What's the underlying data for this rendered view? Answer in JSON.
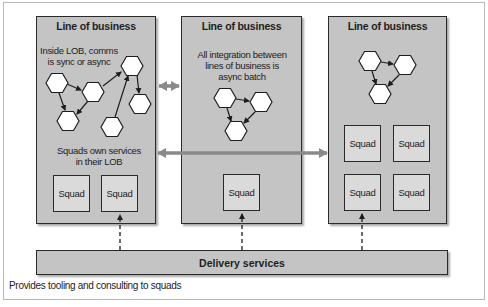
{
  "diagram": {
    "panels": [
      {
        "title": "Line of business",
        "notes": [
          "Inside LOB, comms\nis sync or async",
          "Squads own services\nin their LOB"
        ],
        "squads": [
          "Squad",
          "Squad"
        ]
      },
      {
        "title": "Line of business",
        "notes": [
          "All integration between\nlines of business is\nasync batch"
        ],
        "squads": [
          "Squad"
        ]
      },
      {
        "title": "Line of business",
        "notes": [],
        "squads": [
          "Squad",
          "Squad",
          "Squad",
          "Squad"
        ]
      }
    ],
    "note_lines": {
      "left_top_1": "Inside LOB, comms",
      "left_top_2": "is sync or async",
      "left_bottom_1": "Squads own services",
      "left_bottom_2": "in their LOB",
      "middle_1": "All integration between",
      "middle_2": "lines of business is",
      "middle_3": "async batch"
    },
    "delivery": {
      "label": "Delivery services",
      "caption": "Provides tooling and consulting to squads"
    },
    "colors": {
      "panel_fill": "#c4c4c4",
      "squad_fill": "#dadada",
      "border": "#2a2a2a",
      "connector_gray": "#8a8a8a",
      "hex_fill": "#ffffff"
    }
  }
}
